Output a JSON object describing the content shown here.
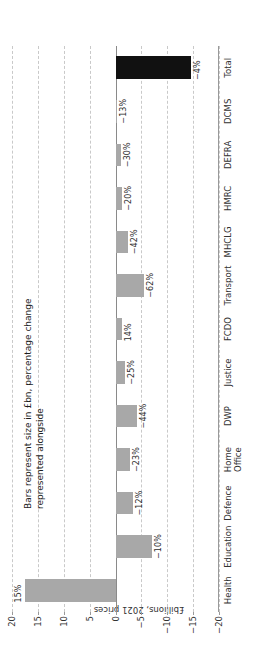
{
  "chart_data": {
    "type": "bar",
    "orientation": "vertical",
    "title": "",
    "subtitle": "",
    "annotation": "Bars represent size in £bn, percentage change\nrepresented alongside",
    "xlabel": "",
    "ylabel": "£billions, 2021 prices",
    "ylim": [
      -20,
      20
    ],
    "yticks": [
      20,
      15,
      10,
      5,
      0,
      -5,
      -10,
      -15,
      -20
    ],
    "ytick_labels": [
      "20",
      "15",
      "10",
      "5",
      "0",
      "−5",
      "−10",
      "−15",
      "−20"
    ],
    "grid": true,
    "grid_style": "dashed",
    "legend": "none",
    "categories": [
      "Health",
      "Education",
      "Defence",
      "Home\nOffice",
      "DWP",
      "Justice",
      "FCDO",
      "Transport",
      "MHCLG",
      "HMRC",
      "DEFRA",
      "DCMS",
      "Total"
    ],
    "values": [
      17.5,
      -7.0,
      -3.3,
      -2.8,
      -4.2,
      -1.9,
      -1.2,
      -5.5,
      -2.5,
      -1.3,
      -1.1,
      -0.25,
      -14.5
    ],
    "point_labels": [
      "15%",
      "−10%",
      "−12%",
      "−23%",
      "−44%",
      "−25%",
      "14%",
      "−62%",
      "−42%",
      "−20%",
      "−30%",
      "−13%",
      "−4%"
    ],
    "bar_colors": [
      "#a8a8a8",
      "#a8a8a8",
      "#a8a8a8",
      "#a8a8a8",
      "#a8a8a8",
      "#a8a8a8",
      "#a8a8a8",
      "#a8a8a8",
      "#a8a8a8",
      "#a8a8a8",
      "#a8a8a8",
      "#a8a8a8",
      "#111111"
    ],
    "colors": {
      "bar_default": "#a8a8a8",
      "bar_total": "#111111",
      "grid": "#c9c9c9",
      "axis": "#9a9a9a",
      "text": "#333333"
    }
  }
}
